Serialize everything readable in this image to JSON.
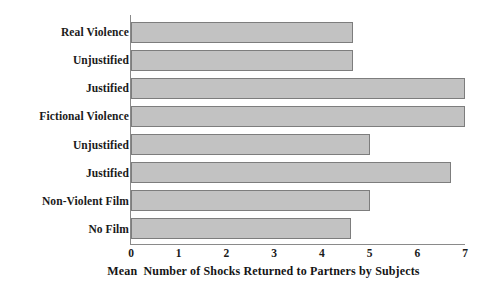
{
  "chart_data": {
    "type": "bar",
    "orientation": "horizontal",
    "title": "",
    "xlabel": "Mean  Number of Shocks Returned to Partners by Subjects",
    "ylabel": "",
    "xlim": [
      0,
      7
    ],
    "xticks": [
      "0",
      "1",
      "2",
      "3",
      "4",
      "5",
      "6",
      "7"
    ],
    "grid": false,
    "legend": null,
    "categories": [
      "Real Violence",
      "Unjustified",
      "Justified",
      "Fictional Violence",
      "Unjustified",
      "Justified",
      "Non-Violent Film",
      "No Film"
    ],
    "values": [
      4.65,
      4.65,
      7.0,
      7.0,
      5.0,
      6.7,
      5.0,
      4.6
    ],
    "bar_fill_color": "#c2c2c2",
    "bar_edge_color": "#7d7d7d",
    "axis_color": "#8a8a8a",
    "background_color": "#ffffff",
    "text_color": "#1a1a1a"
  }
}
